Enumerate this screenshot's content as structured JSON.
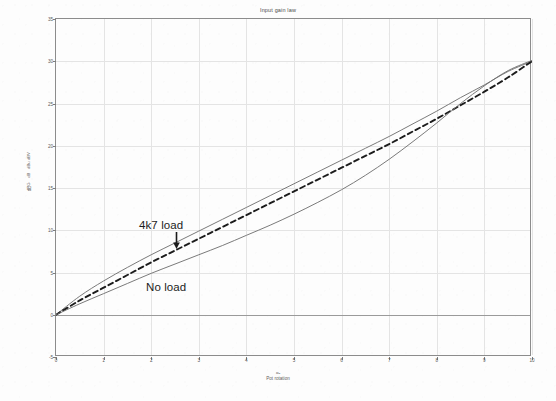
{
  "chart_data": {
    "type": "line",
    "title": "Input gain law",
    "xlabel": "Pot rotation",
    "xlabel_symbol": "αₐ",
    "ylabel_lines": [
      "G",
      "dB",
      "dBu",
      "dBV"
    ],
    "ylabel_unit": "dB",
    "xlim": [
      0,
      10
    ],
    "ylim": [
      -5,
      35
    ],
    "xticks": [
      0,
      1,
      2,
      3,
      4,
      5,
      6,
      7,
      8,
      9,
      10
    ],
    "yticks": [
      -5,
      0,
      5,
      10,
      15,
      20,
      25,
      30,
      35
    ],
    "grid": true,
    "legend_position": "inline-annotations",
    "zero_reference": 0,
    "annotations": [
      {
        "id": "ann-4k7",
        "text": "4k7 load",
        "points_to_series": "4k7 load"
      },
      {
        "id": "ann-noload",
        "text": "No load",
        "points_to_series": "No load"
      }
    ],
    "x": [
      0,
      0.5,
      1,
      1.5,
      2,
      2.5,
      3,
      3.5,
      4,
      4.5,
      5,
      5.5,
      6,
      6.5,
      7,
      7.5,
      8,
      8.5,
      9,
      9.5,
      10
    ],
    "series": [
      {
        "name": "4k7 load",
        "style": "solid",
        "color": "#6b6b6b",
        "values": [
          0.0,
          2.2,
          4.0,
          5.6,
          7.1,
          8.5,
          9.9,
          11.3,
          12.7,
          14.1,
          15.5,
          16.9,
          18.3,
          19.7,
          21.1,
          22.6,
          24.1,
          25.7,
          27.2,
          28.8,
          30.0
        ]
      },
      {
        "name": "Ideal / reference",
        "style": "dashed",
        "color": "#1c1c1c",
        "values": [
          0.0,
          1.7,
          3.2,
          4.7,
          6.2,
          7.6,
          9.0,
          10.4,
          11.8,
          13.2,
          14.6,
          16.0,
          17.4,
          18.8,
          20.2,
          21.7,
          23.2,
          24.8,
          26.4,
          28.1,
          30.0
        ]
      },
      {
        "name": "No load",
        "style": "solid",
        "color": "#6b6b6b",
        "values": [
          0.0,
          1.3,
          2.5,
          3.7,
          4.9,
          6.0,
          7.1,
          8.2,
          9.4,
          10.6,
          11.9,
          13.3,
          14.8,
          16.5,
          18.4,
          20.5,
          22.7,
          25.0,
          27.1,
          28.9,
          30.1
        ]
      }
    ]
  }
}
